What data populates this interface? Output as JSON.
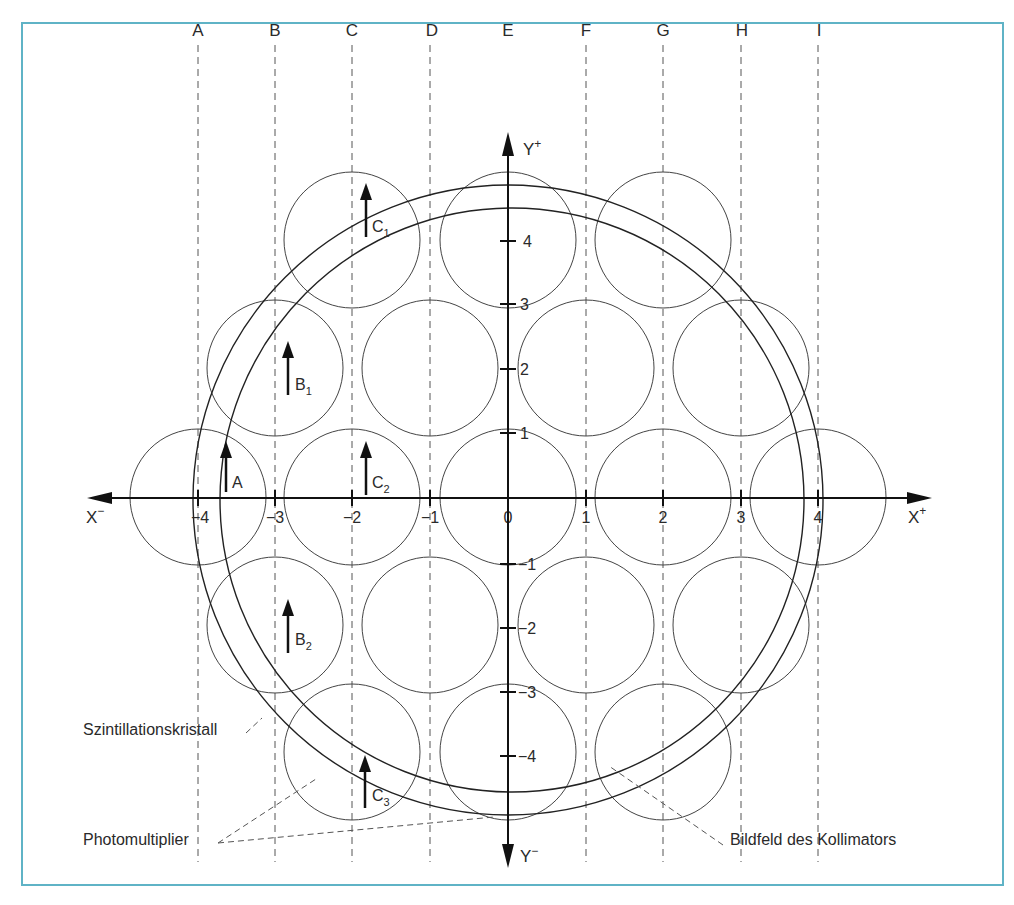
{
  "frame": {
    "border_color": "#5fb3c6"
  },
  "columns": [
    {
      "label": "A",
      "x": 198
    },
    {
      "label": "B",
      "x": 275
    },
    {
      "label": "C",
      "x": 352
    },
    {
      "label": "D",
      "x": 430
    },
    {
      "label": "E",
      "x": 508
    },
    {
      "label": "F",
      "x": 586
    },
    {
      "label": "G",
      "x": 663
    },
    {
      "label": "H",
      "x": 741
    },
    {
      "label": "I",
      "x": 818
    }
  ],
  "axes": {
    "x_minus_label": "X",
    "x_minus_sup": "−",
    "x_plus_label": "X",
    "x_plus_sup": "+",
    "y_plus_label": "Y",
    "y_plus_sup": "+",
    "y_minus_label": "Y",
    "y_minus_sup": "−",
    "x_ticks": [
      "−4",
      "−3",
      "−2",
      "−1",
      "0",
      "1",
      "2",
      "3",
      "4"
    ],
    "y_ticks_pos": [
      "4",
      "3",
      "2",
      "1"
    ],
    "y_ticks_neg": [
      "−1",
      "−2",
      "−3",
      "−4"
    ]
  },
  "arrows": [
    {
      "label": "A",
      "sub": ""
    },
    {
      "label": "B",
      "sub": "1"
    },
    {
      "label": "B",
      "sub": "2"
    },
    {
      "label": "C",
      "sub": "1"
    },
    {
      "label": "C",
      "sub": "2"
    },
    {
      "label": "C",
      "sub": "3"
    }
  ],
  "annotations": {
    "crystal": "Szintillationskristall",
    "photomultiplier": "Photomultiplier",
    "collimator_field": "Bildfeld des Kollimators"
  },
  "photomultiplier_count": 19
}
